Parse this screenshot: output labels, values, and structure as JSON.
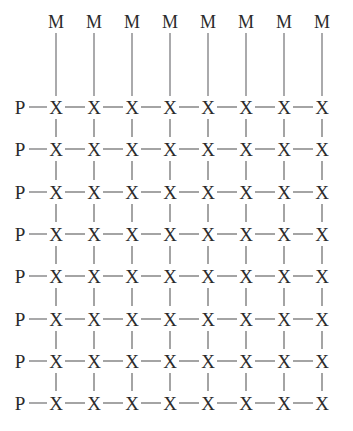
{
  "figure": {
    "kind": "chemical-lattice-diagram",
    "background_color": "#ffffff",
    "bond_color": "#4a4a4a",
    "label_color": "#2b2b2b",
    "rows": 8,
    "columns": 8
  },
  "labels": {
    "metal": "M",
    "phosphorus": "P",
    "bridging": "X"
  },
  "top_row_metals": [
    "M",
    "M",
    "M",
    "M",
    "M",
    "M",
    "M",
    "M"
  ],
  "left_column_ligands": [
    "P",
    "P",
    "P",
    "P",
    "P",
    "P",
    "P",
    "P"
  ],
  "lattice_rows": [
    {
      "lead": "P",
      "nodes": [
        "X",
        "X",
        "X",
        "X",
        "X",
        "X",
        "X",
        "X"
      ]
    },
    {
      "lead": "P",
      "nodes": [
        "X",
        "X",
        "X",
        "X",
        "X",
        "X",
        "X",
        "X"
      ]
    },
    {
      "lead": "P",
      "nodes": [
        "X",
        "X",
        "X",
        "X",
        "X",
        "X",
        "X",
        "X"
      ]
    },
    {
      "lead": "P",
      "nodes": [
        "X",
        "X",
        "X",
        "X",
        "X",
        "X",
        "X",
        "X"
      ]
    },
    {
      "lead": "P",
      "nodes": [
        "X",
        "X",
        "X",
        "X",
        "X",
        "X",
        "X",
        "X"
      ]
    },
    {
      "lead": "P",
      "nodes": [
        "X",
        "X",
        "X",
        "X",
        "X",
        "X",
        "X",
        "X"
      ]
    },
    {
      "lead": "P",
      "nodes": [
        "X",
        "X",
        "X",
        "X",
        "X",
        "X",
        "X",
        "X"
      ]
    },
    {
      "lead": "P",
      "nodes": [
        "X",
        "X",
        "X",
        "X",
        "X",
        "X",
        "X",
        "X"
      ]
    }
  ],
  "geometry": {
    "metal_label_y": 22,
    "first_row_y": 107,
    "row_spacing": 42.3,
    "first_col_x": 56,
    "col_spacing": 38,
    "lead_label_x": 20
  }
}
